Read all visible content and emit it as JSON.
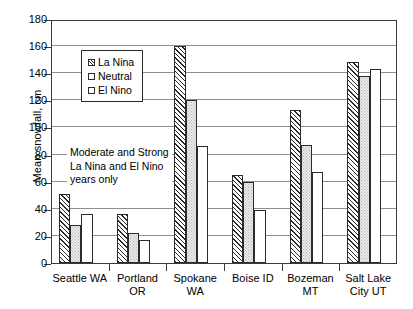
{
  "chart_data": {
    "type": "bar",
    "title": "",
    "xlabel": "",
    "ylabel": "Mean snowfall, cm",
    "ylim": [
      0,
      180
    ],
    "ytick_step": 20,
    "yticks": [
      0,
      20,
      40,
      60,
      80,
      100,
      120,
      140,
      160,
      180
    ],
    "ytick_labels": [
      "0",
      "20",
      "40",
      "60",
      "80",
      "100",
      "120",
      "140",
      "160",
      "180"
    ],
    "grid": "horizontal",
    "legend_position": "upper-left-inside",
    "categories": [
      "Seattle WA",
      "Portland\nOR",
      "Spokane\nWA",
      "Boise ID",
      "Bozeman\nMT",
      "Salt Lake\nCity UT"
    ],
    "series": [
      {
        "name": "La Nina",
        "fill": "diagonal-hatch",
        "values": [
          51,
          36,
          160,
          65,
          113,
          148
        ]
      },
      {
        "name": "Neutral",
        "fill": "light-gray-stipple",
        "values": [
          28,
          22,
          120,
          60,
          87,
          138
        ]
      },
      {
        "name": "El Nino",
        "fill": "white",
        "values": [
          36,
          17,
          86,
          39,
          67,
          143
        ]
      }
    ],
    "annotations": [
      {
        "text": "Moderate and Strong\nLa Nina and El Nino\nyears only",
        "value_level": 80
      }
    ]
  },
  "legend": {
    "items": [
      {
        "label": "La Nina"
      },
      {
        "label": "Neutral"
      },
      {
        "label": "El Nino"
      }
    ]
  },
  "colors": {
    "axis": "#3a3a3a",
    "grid": "#8e8e8e",
    "bar_outline": "#2b2b2b",
    "neutral_fill": "#e9e9e9",
    "background": "#ffffff"
  }
}
